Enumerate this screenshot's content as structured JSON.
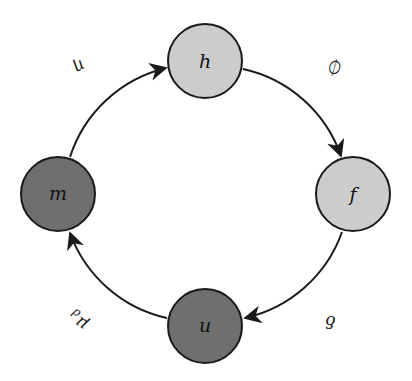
{
  "diagram": {
    "type": "cycle",
    "colors": {
      "light_node": "#cccccc",
      "dark_node": "#6f6f6f",
      "stroke": "#1a1a1a"
    },
    "nodes": [
      {
        "id": "h",
        "label": "h",
        "shade": "light"
      },
      {
        "id": "f",
        "label": "f",
        "shade": "light"
      },
      {
        "id": "u",
        "label": "u",
        "shade": "dark"
      },
      {
        "id": "m",
        "label": "m",
        "shade": "dark"
      }
    ],
    "edges": [
      {
        "from": "m",
        "to": "h",
        "label": "η"
      },
      {
        "from": "h",
        "to": "f",
        "label": "∅"
      },
      {
        "from": "f",
        "to": "u",
        "label": "δ"
      },
      {
        "from": "u",
        "to": "m",
        "label": "μ",
        "label_sub": "d"
      }
    ]
  }
}
